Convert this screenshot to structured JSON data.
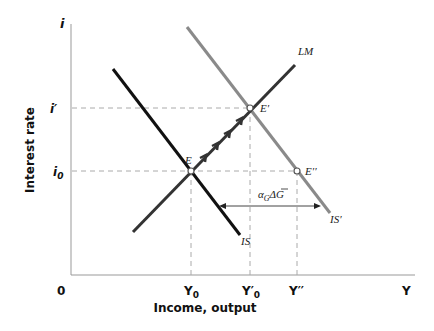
{
  "axes": {
    "y_label": "i",
    "x_label": "Y",
    "origin_label": "0",
    "y_title": "Interest rate",
    "x_title": "Income, output"
  },
  "ticks": {
    "y": [
      {
        "label": "i′",
        "y": 108
      },
      {
        "label": "i",
        "sub": "0",
        "y": 171
      }
    ],
    "x": [
      {
        "label": "Y",
        "sub": "0",
        "x": 191
      },
      {
        "label": "Y′",
        "sub": "0",
        "x": 250
      },
      {
        "label": "Y′′",
        "x": 297
      }
    ]
  },
  "curves": {
    "IS": {
      "label": "IS",
      "color": "#111111"
    },
    "IS_prime": {
      "label": "IS′",
      "color": "#8a8a8a"
    },
    "LM": {
      "label": "LM",
      "color": "#333333"
    }
  },
  "points": {
    "E": {
      "label": "E"
    },
    "E_prime": {
      "label": "E′"
    },
    "E_double_prime": {
      "label": "E′′"
    }
  },
  "shift": {
    "label_alpha": "α",
    "label_sub": "G",
    "label_rest": "ΔG"
  }
}
